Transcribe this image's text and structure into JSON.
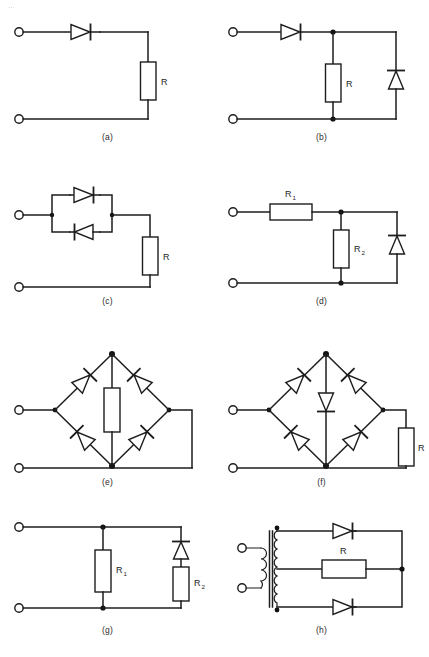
{
  "page": {
    "header_fragment": "...",
    "width": 429,
    "height": 657,
    "background": "#ffffff",
    "ink_color": "#1d1d1d"
  },
  "figure": {
    "panel_count": 8
  },
  "panels": [
    {
      "id": "a",
      "caption": "(a)",
      "description": "Half-wave rectifier: series diode feeding load resistor R",
      "components": [
        {
          "kind": "terminal",
          "name": "input-top-terminal"
        },
        {
          "kind": "terminal",
          "name": "input-bottom-terminal"
        },
        {
          "kind": "diode",
          "name": "series-diode",
          "orientation": "right"
        },
        {
          "kind": "resistor",
          "name": "load-resistor",
          "label": "R",
          "orientation": "vertical"
        }
      ],
      "labels": [
        "R"
      ]
    },
    {
      "id": "b",
      "caption": "(b)",
      "description": "Series diode with shunt resistor R and shunt clamping diode",
      "components": [
        {
          "kind": "terminal",
          "name": "input-top-terminal"
        },
        {
          "kind": "terminal",
          "name": "input-bottom-terminal"
        },
        {
          "kind": "diode",
          "name": "series-diode",
          "orientation": "right"
        },
        {
          "kind": "resistor",
          "name": "shunt-resistor",
          "label": "R",
          "orientation": "vertical"
        },
        {
          "kind": "diode",
          "name": "shunt-diode",
          "orientation": "up"
        }
      ],
      "labels": [
        "R"
      ]
    },
    {
      "id": "c",
      "caption": "(c)",
      "description": "Two anti-parallel diodes in series with load resistor R",
      "components": [
        {
          "kind": "terminal",
          "name": "input-top-terminal"
        },
        {
          "kind": "terminal",
          "name": "input-bottom-terminal"
        },
        {
          "kind": "diode",
          "name": "antiparallel-diode-upper",
          "orientation": "right"
        },
        {
          "kind": "diode",
          "name": "antiparallel-diode-lower",
          "orientation": "left"
        },
        {
          "kind": "resistor",
          "name": "load-resistor",
          "label": "R",
          "orientation": "vertical"
        }
      ],
      "labels": [
        "R"
      ]
    },
    {
      "id": "d",
      "caption": "(d)",
      "description": "Series resistor R1, shunt resistor R2 and shunt diode",
      "components": [
        {
          "kind": "terminal",
          "name": "input-top-terminal"
        },
        {
          "kind": "terminal",
          "name": "input-bottom-terminal"
        },
        {
          "kind": "resistor",
          "name": "series-resistor",
          "label": "R",
          "sub": "1",
          "orientation": "horizontal"
        },
        {
          "kind": "resistor",
          "name": "shunt-resistor",
          "label": "R",
          "sub": "2",
          "orientation": "vertical"
        },
        {
          "kind": "diode",
          "name": "shunt-diode",
          "orientation": "up"
        }
      ],
      "labels": [
        "R1",
        "R2"
      ]
    },
    {
      "id": "e",
      "caption": "(e)",
      "description": "Full-wave bridge rectifier with resistor across the diagonal",
      "components": [
        {
          "kind": "terminal",
          "name": "input-top-terminal"
        },
        {
          "kind": "terminal",
          "name": "input-bottom-terminal"
        },
        {
          "kind": "diode",
          "name": "bridge-diode-top-left",
          "orientation": "up-right"
        },
        {
          "kind": "diode",
          "name": "bridge-diode-top-right",
          "orientation": "up-left"
        },
        {
          "kind": "diode",
          "name": "bridge-diode-bottom-left",
          "orientation": "up-left"
        },
        {
          "kind": "diode",
          "name": "bridge-diode-bottom-right",
          "orientation": "up-right"
        },
        {
          "kind": "resistor",
          "name": "bridge-center-resistor",
          "label": "",
          "orientation": "vertical"
        }
      ],
      "labels": []
    },
    {
      "id": "f",
      "caption": "(f)",
      "description": "Full-wave bridge rectifier with diode across the diagonal and external load resistor R",
      "components": [
        {
          "kind": "terminal",
          "name": "input-top-terminal"
        },
        {
          "kind": "terminal",
          "name": "input-bottom-terminal"
        },
        {
          "kind": "diode",
          "name": "bridge-diode-top-left",
          "orientation": "up-right"
        },
        {
          "kind": "diode",
          "name": "bridge-diode-top-right",
          "orientation": "up-left"
        },
        {
          "kind": "diode",
          "name": "bridge-diode-bottom-left",
          "orientation": "up-left"
        },
        {
          "kind": "diode",
          "name": "bridge-diode-bottom-right",
          "orientation": "up-right"
        },
        {
          "kind": "diode",
          "name": "bridge-center-diode",
          "orientation": "down"
        },
        {
          "kind": "resistor",
          "name": "load-resistor",
          "label": "R",
          "orientation": "vertical"
        }
      ],
      "labels": [
        "R"
      ]
    },
    {
      "id": "g",
      "caption": "(g)",
      "description": "Shunt resistor R1 in parallel with a series diode and resistor R2 branch",
      "components": [
        {
          "kind": "terminal",
          "name": "input-top-terminal"
        },
        {
          "kind": "terminal",
          "name": "input-bottom-terminal"
        },
        {
          "kind": "resistor",
          "name": "shunt-resistor-1",
          "label": "R",
          "sub": "1",
          "orientation": "vertical"
        },
        {
          "kind": "diode",
          "name": "branch-diode",
          "orientation": "up"
        },
        {
          "kind": "resistor",
          "name": "branch-resistor-2",
          "label": "R",
          "sub": "2",
          "orientation": "vertical"
        }
      ],
      "labels": [
        "R1",
        "R2"
      ]
    },
    {
      "id": "h",
      "caption": "(h)",
      "description": "Centre-tapped transformer full-wave rectifier with two diodes and load resistor R",
      "components": [
        {
          "kind": "terminal",
          "name": "primary-top-terminal"
        },
        {
          "kind": "terminal",
          "name": "primary-bottom-terminal"
        },
        {
          "kind": "transformer",
          "name": "centre-tapped-transformer"
        },
        {
          "kind": "diode",
          "name": "top-rectifier-diode",
          "orientation": "right"
        },
        {
          "kind": "diode",
          "name": "bottom-rectifier-diode",
          "orientation": "right"
        },
        {
          "kind": "resistor",
          "name": "load-resistor",
          "label": "R",
          "orientation": "horizontal"
        }
      ],
      "labels": [
        "R"
      ]
    }
  ],
  "labels": {
    "R": "R",
    "R_letter": "R",
    "sub_1": "1",
    "sub_2": "2"
  },
  "captions": {
    "a": "(a)",
    "b": "(b)",
    "c": "(c)",
    "d": "(d)",
    "e": "(e)",
    "f": "(f)",
    "g": "(g)",
    "h": "(h)"
  }
}
